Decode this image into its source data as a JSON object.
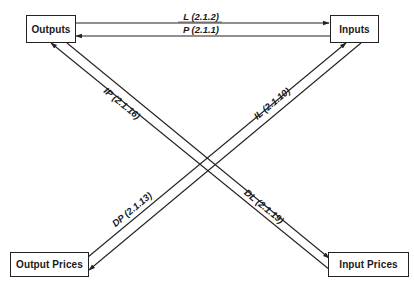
{
  "diagram": {
    "type": "flow-diagram",
    "colors": {
      "stroke": "#222222",
      "background": "#ffffff",
      "text": "#1a1a1a"
    },
    "nodes": [
      {
        "id": "outputs",
        "label": "Outputs"
      },
      {
        "id": "inputs",
        "label": "Inputs"
      },
      {
        "id": "output_prices",
        "label": "Output Prices"
      },
      {
        "id": "input_prices",
        "label": "Input Prices"
      }
    ],
    "edges": [
      {
        "id": "L",
        "from": "outputs",
        "to": "inputs",
        "label": "L (2.1.2)",
        "var": "L",
        "ref": "(2.1.2)"
      },
      {
        "id": "P",
        "from": "inputs",
        "to": "outputs",
        "label": "P (2.1.1)",
        "var": "P",
        "ref": "(2.1.1)"
      },
      {
        "id": "IP",
        "from": "input_prices",
        "to": "outputs",
        "label": "IP (2.1.16)",
        "var": "IP",
        "ref": "(2.1.16)"
      },
      {
        "id": "DL",
        "from": "outputs",
        "to": "input_prices",
        "label": "DL (2.1.19)",
        "var": "DL",
        "ref": "(2.1.19)"
      },
      {
        "id": "IL",
        "from": "output_prices",
        "to": "inputs",
        "label": "IL (2.1.10)",
        "var": "IL",
        "ref": "(2.1.10)"
      },
      {
        "id": "DP",
        "from": "inputs",
        "to": "output_prices",
        "label": "DP (2.1.13)",
        "var": "DP",
        "ref": "(2.1.13)"
      }
    ]
  }
}
